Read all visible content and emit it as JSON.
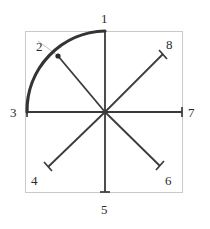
{
  "figure": {
    "title": "",
    "type": "eight-spoke-star-with-quarter-arc",
    "background_color": "#ffffff",
    "frame": {
      "name": "bounding-square",
      "x": 25,
      "y": 31,
      "width": 157,
      "height": 161,
      "stroke_color": "#c9c9c9",
      "stroke_width": 1
    },
    "center": {
      "name": "center-hub",
      "x": 105,
      "y": 112,
      "label": ""
    },
    "spoke_style": {
      "stroke_color": "#3a3a3a",
      "stroke_width": 1.8,
      "tick_length": 9,
      "tick_stroke_width": 1.6
    },
    "arc": {
      "name": "quarter-circle-arc",
      "from_point": "3",
      "through_point": "2",
      "to_point": "1",
      "radius": 80,
      "stroke_color": "#343434",
      "stroke_width": 3.2
    },
    "leader_line": {
      "name": "leader-line-to-point-2",
      "from_x": 38,
      "from_y": 41,
      "to_x": 57,
      "to_y": 55,
      "stroke_color": "#bdbdbd",
      "stroke_width": 1
    },
    "points": [
      {
        "id": "1",
        "label": "1",
        "name": "point-1-top",
        "x": 105,
        "y": 31,
        "label_x": 101,
        "label_y": 12,
        "tick": "none",
        "on_arc": true
      },
      {
        "id": "2",
        "label": "2",
        "name": "point-2-upper-left",
        "x": 58,
        "y": 56,
        "label_x": 36,
        "label_y": 40,
        "tick": "dot",
        "on_arc": true
      },
      {
        "id": "3",
        "label": "3",
        "name": "point-3-left",
        "x": 27,
        "y": 112,
        "label_x": 10,
        "label_y": 106,
        "tick": "vertical",
        "on_arc": true
      },
      {
        "id": "4",
        "label": "4",
        "name": "point-4-lower-left",
        "x": 48,
        "y": 167,
        "label_x": 31,
        "label_y": 174,
        "tick": "perpendicular",
        "on_arc": false
      },
      {
        "id": "5",
        "label": "5",
        "name": "point-5-bottom",
        "x": 105,
        "y": 192,
        "label_x": 101,
        "label_y": 203,
        "tick": "horizontal",
        "on_arc": false
      },
      {
        "id": "6",
        "label": "6",
        "name": "point-6-lower-right",
        "x": 160,
        "y": 166,
        "label_x": 165,
        "label_y": 174,
        "tick": "perpendicular",
        "on_arc": false
      },
      {
        "id": "7",
        "label": "7",
        "name": "point-7-right",
        "x": 182,
        "y": 112,
        "label_x": 188,
        "label_y": 106,
        "tick": "vertical",
        "on_arc": false
      },
      {
        "id": "8",
        "label": "8",
        "name": "point-8-upper-right",
        "x": 163,
        "y": 54,
        "label_x": 166,
        "label_y": 38,
        "tick": "perpendicular",
        "on_arc": false
      }
    ]
  }
}
